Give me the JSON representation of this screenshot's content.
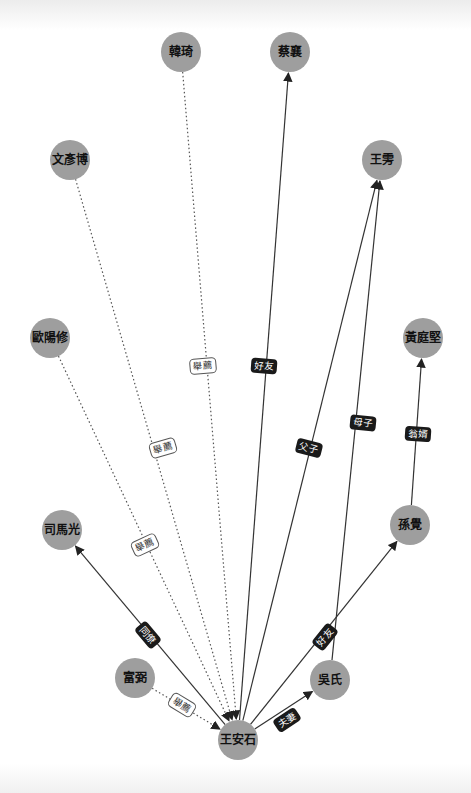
{
  "graph": {
    "center": "王安石",
    "colors": {
      "node_fill": "#9e9e9e",
      "edge": "#333333",
      "label_dark_bg": "#1a1a1a",
      "label_light_bg": "#ffffff"
    },
    "nodes": [
      {
        "id": "wang_anshi",
        "label": "王安石",
        "x": 238,
        "y": 740
      },
      {
        "id": "han_qi",
        "label": "韓琦",
        "x": 181,
        "y": 52
      },
      {
        "id": "cai_xiang",
        "label": "蔡襄",
        "x": 290,
        "y": 52
      },
      {
        "id": "wen_yanbo",
        "label": "文彥博",
        "x": 70,
        "y": 160
      },
      {
        "id": "wang_pang",
        "label": "王雱",
        "x": 382,
        "y": 160
      },
      {
        "id": "ouyang_xiu",
        "label": "歐陽修",
        "x": 50,
        "y": 338
      },
      {
        "id": "huang_tingjian",
        "label": "黃庭堅",
        "x": 423,
        "y": 338
      },
      {
        "id": "sima_guang",
        "label": "司馬光",
        "x": 62,
        "y": 530
      },
      {
        "id": "sun_jue",
        "label": "孫覺",
        "x": 410,
        "y": 525
      },
      {
        "id": "fu_bi",
        "label": "富弼",
        "x": 135,
        "y": 678
      },
      {
        "id": "wu_shi",
        "label": "吳氏",
        "x": 330,
        "y": 680
      }
    ],
    "edges": [
      {
        "from": "han_qi",
        "to": "wang_anshi",
        "label": "舉薦",
        "style": "dotted",
        "lx": 203,
        "ly": 366
      },
      {
        "from": "wen_yanbo",
        "to": "wang_anshi",
        "label": "舉薦",
        "style": "dotted",
        "lx": 163,
        "ly": 448
      },
      {
        "from": "ouyang_xiu",
        "to": "wang_anshi",
        "label": "舉薦",
        "style": "dotted",
        "lx": 145,
        "ly": 545
      },
      {
        "from": "fu_bi",
        "to": "wang_anshi",
        "label": "舉薦",
        "style": "dotted",
        "lx": 182,
        "ly": 705
      },
      {
        "from": "wang_anshi",
        "to": "cai_xiang",
        "label": "好友",
        "style": "solid",
        "lx": 264,
        "ly": 366
      },
      {
        "from": "wang_anshi",
        "to": "sima_guang",
        "label": "同僚",
        "style": "solid",
        "lx": 148,
        "ly": 635
      },
      {
        "from": "wang_anshi",
        "to": "wang_pang",
        "label": "父子",
        "style": "solid",
        "lx": 309,
        "ly": 448
      },
      {
        "from": "wang_anshi",
        "to": "wu_shi",
        "label": "夫妻",
        "style": "solid",
        "lx": 287,
        "ly": 720
      },
      {
        "from": "wang_anshi",
        "to": "sun_jue",
        "label": "好友",
        "style": "solid",
        "lx": 325,
        "ly": 637
      },
      {
        "from": "wu_shi",
        "to": "wang_pang",
        "label": "母子",
        "style": "solid",
        "lx": 363,
        "ly": 423
      },
      {
        "from": "sun_jue",
        "to": "huang_tingjian",
        "label": "翁婿",
        "style": "solid",
        "lx": 418,
        "ly": 434
      }
    ]
  }
}
